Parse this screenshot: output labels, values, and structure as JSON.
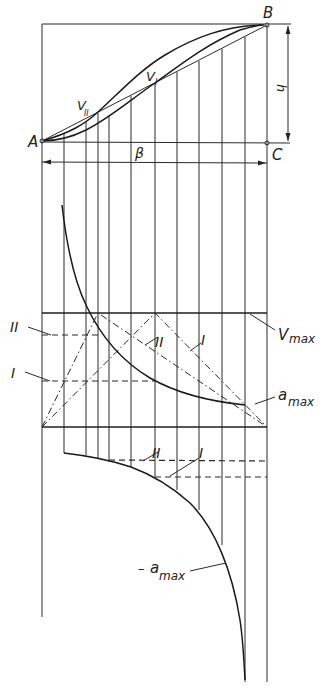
{
  "figure": {
    "points": {
      "A": "A",
      "B": "B",
      "C": "C"
    },
    "labels": {
      "height": "h",
      "angle": "β",
      "velocity_I": "V",
      "velocity_I_sub": "I",
      "velocity_II": "V",
      "velocity_II_sub": "II",
      "vmax": "V",
      "vmax_sub": "max",
      "amax": "a",
      "amax_sub": "max",
      "neg_amax_sign": "–",
      "neg_amax": "a",
      "neg_amax_sub": "max",
      "curve_I_left": "I",
      "curve_II_left": "II",
      "curve_I_mid": "I",
      "curve_II_mid": "II",
      "curve_I_low": "I",
      "curve_II_low": "II"
    },
    "grid_x": [
      42,
      64,
      86,
      98,
      109,
      131,
      155,
      177,
      199,
      222,
      245,
      267
    ],
    "colors": {
      "ink": "#1e1e1e",
      "background": "#ffffff"
    }
  }
}
